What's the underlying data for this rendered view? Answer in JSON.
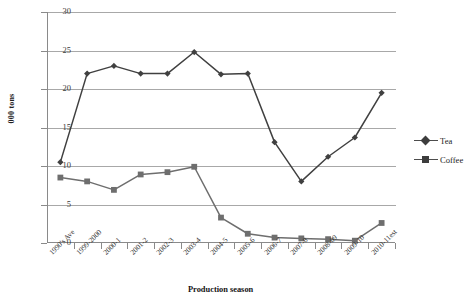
{
  "chart_data": {
    "type": "line",
    "title": "",
    "xlabel": "Production season",
    "ylabel": "000 tons",
    "ylim": [
      0,
      30
    ],
    "ytick_step": 5,
    "yticks": [
      "30",
      "25",
      "20",
      "15",
      "10",
      "5",
      "0"
    ],
    "grid": true,
    "legend_position": "right",
    "categories": [
      "1990's Ave",
      "1999-2000",
      "2000-1",
      "2001-2",
      "2002-3",
      "2003-4",
      "2004-5",
      "2005-6",
      "2006-7",
      "2007-8",
      "2008-09",
      "2009-10",
      "2010-11est"
    ],
    "series": [
      {
        "name": "Tea",
        "marker": "diamond",
        "color": "#404040",
        "values": [
          10.5,
          22.0,
          23.0,
          22.0,
          22.0,
          24.8,
          21.9,
          22.0,
          13.1,
          8.0,
          11.2,
          13.7,
          19.5
        ]
      },
      {
        "name": "Coffee",
        "marker": "square",
        "color": "#6e6e6e",
        "values": [
          8.5,
          8.0,
          6.9,
          8.9,
          9.2,
          9.9,
          3.3,
          1.2,
          0.7,
          0.6,
          0.5,
          0.3,
          2.6
        ]
      }
    ]
  },
  "legend": {
    "items": [
      {
        "label": "Tea"
      },
      {
        "label": "Coffee"
      }
    ]
  }
}
